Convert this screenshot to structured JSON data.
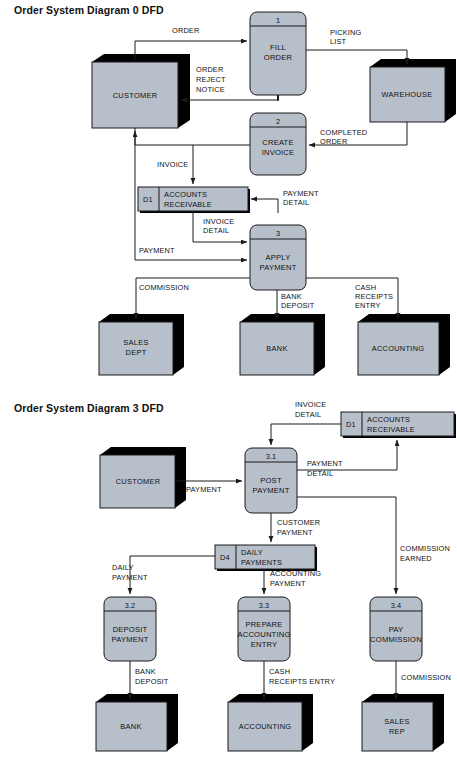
{
  "page": {
    "width": 457,
    "height": 759,
    "background": "#ffffff",
    "shape_fill": "#b7bfcb",
    "shape_stroke": "#1a1a1a",
    "shadow_color": "#000000"
  },
  "diagrams": [
    {
      "id": "diagram-0",
      "title": "Order System Diagram 0 DFD",
      "entities": [
        {
          "id": "customer",
          "label": "CUSTOMER"
        },
        {
          "id": "warehouse",
          "label": "WAREHOUSE"
        },
        {
          "id": "sales-dept",
          "label_line1": "SALES",
          "label_line2": "DEPT"
        },
        {
          "id": "bank",
          "label": "BANK"
        },
        {
          "id": "accounting",
          "label": "ACCOUNTING"
        }
      ],
      "processes": [
        {
          "id": "fill-order",
          "number": "1",
          "line1": "FILL",
          "line2": "ORDER"
        },
        {
          "id": "create-invoice",
          "number": "2",
          "line1": "CREATE",
          "line2": "INVOICE"
        },
        {
          "id": "apply-payment",
          "number": "3",
          "line1": "APPLY",
          "line2": "PAYMENT"
        }
      ],
      "data_stores": [
        {
          "id": "d1",
          "key": "D1",
          "line1": "ACCOUNTS",
          "line2": "RECEIVABLE"
        }
      ],
      "flows": [
        {
          "id": "order",
          "line1": "ORDER"
        },
        {
          "id": "picking-list",
          "line1": "PICKING",
          "line2": "LIST"
        },
        {
          "id": "order-reject-notice",
          "line1": "ORDER",
          "line2": "REJECT",
          "line3": "NOTICE"
        },
        {
          "id": "completed-order",
          "line1": "COMPLETED",
          "line2": "ORDER"
        },
        {
          "id": "invoice",
          "line1": "INVOICE"
        },
        {
          "id": "payment-detail",
          "line1": "PAYMENT",
          "line2": "DETAIL"
        },
        {
          "id": "invoice-detail",
          "line1": "INVOICE",
          "line2": "DETAIL"
        },
        {
          "id": "payment",
          "line1": "PAYMENT"
        },
        {
          "id": "commission",
          "line1": "COMMISSION"
        },
        {
          "id": "bank-deposit",
          "line1": "BANK",
          "line2": "DEPOSIT"
        },
        {
          "id": "cash-receipts-entry",
          "line1": "CASH",
          "line2": "RECEIPTS",
          "line3": "ENTRY"
        }
      ]
    },
    {
      "id": "diagram-3",
      "title": "Order System Diagram 3 DFD",
      "entities": [
        {
          "id": "customer3",
          "label": "CUSTOMER"
        },
        {
          "id": "bank3",
          "label": "BANK"
        },
        {
          "id": "accounting3",
          "label": "ACCOUNTING"
        },
        {
          "id": "sales-rep",
          "label_line1": "SALES",
          "label_line2": "REP"
        }
      ],
      "processes": [
        {
          "id": "post-payment",
          "number": "3.1",
          "line1": "POST",
          "line2": "PAYMENT"
        },
        {
          "id": "deposit-payment",
          "number": "3.2",
          "line1": "DEPOSIT",
          "line2": "PAYMENT"
        },
        {
          "id": "prepare-accounting",
          "number": "3.3",
          "line1": "PREPARE",
          "line2": "ACCOUNTING",
          "line3": "ENTRY"
        },
        {
          "id": "pay-commission",
          "number": "3.4",
          "line1": "PAY",
          "line2": "COMMISSION"
        }
      ],
      "data_stores": [
        {
          "id": "d1b",
          "key": "D1",
          "line1": "ACCOUNTS",
          "line2": "RECEIVABLE"
        },
        {
          "id": "d4",
          "key": "D4",
          "line1": "DAILY",
          "line2": "PAYMENTS"
        }
      ],
      "flows": [
        {
          "id": "invoice-detail3",
          "line1": "INVOICE",
          "line2": "DETAIL"
        },
        {
          "id": "payment3",
          "line1": "PAYMENT"
        },
        {
          "id": "payment-detail3",
          "line1": "PAYMENT",
          "line2": "DETAIL"
        },
        {
          "id": "customer-payment",
          "line1": "CUSTOMER",
          "line2": "PAYMENT"
        },
        {
          "id": "commission-earned",
          "line1": "COMMISSION",
          "line2": "EARNED"
        },
        {
          "id": "daily-payment",
          "line1": "DAILY",
          "line2": "PAYMENT"
        },
        {
          "id": "accounting-payment",
          "line1": "ACCOUNTING",
          "line2": "PAYMENT"
        },
        {
          "id": "bank-deposit3",
          "line1": "BANK",
          "line2": "DEPOSIT"
        },
        {
          "id": "cash-receipts-entry3",
          "line1": "CASH",
          "line2": "RECEIPTS ENTRY"
        },
        {
          "id": "commission3",
          "line1": "COMMISSION"
        }
      ]
    }
  ]
}
